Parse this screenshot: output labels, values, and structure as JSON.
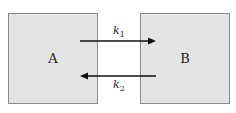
{
  "diagram": {
    "nodes": [
      {
        "id": "A",
        "label": "A",
        "fill": "#e4e4e4"
      },
      {
        "id": "B",
        "label": "B",
        "fill": "#e4e4e4"
      }
    ],
    "edges": [
      {
        "from": "A",
        "to": "B",
        "label_base": "k",
        "label_sub": "1"
      },
      {
        "from": "B",
        "to": "A",
        "label_base": "k",
        "label_sub": "2"
      }
    ]
  }
}
